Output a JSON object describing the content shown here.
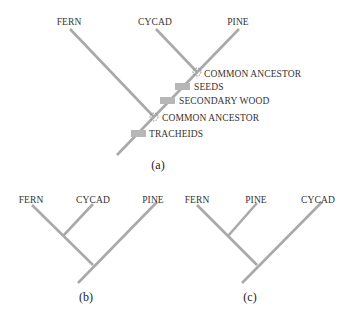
{
  "tree_a": {
    "caption": "(a)",
    "taxa": [
      "FERN",
      "CYCAD",
      "PINE"
    ],
    "nodes": {
      "common_ancestor_upper": "COMMON ANCESTOR",
      "common_ancestor_lower": "COMMON ANCESTOR"
    },
    "characters": {
      "seeds": "SEEDS",
      "secondary_wood": "SECONDARY WOOD",
      "tracheids": "TRACHEIDS"
    }
  },
  "tree_b": {
    "caption": "(b)",
    "taxa": [
      "FERN",
      "CYCAD",
      "PINE"
    ]
  },
  "tree_c": {
    "caption": "(c)",
    "taxa": [
      "FERN",
      "PINE",
      "CYCAD"
    ]
  },
  "colors": {
    "branch": "#a9a9a9",
    "character_box": "#b7b7b7",
    "text": "#333333"
  }
}
